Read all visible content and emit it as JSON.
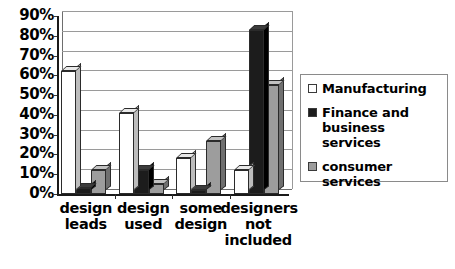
{
  "chart_data": {
    "type": "bar",
    "title": "",
    "xlabel": "",
    "ylabel": "",
    "ylim": [
      0,
      90
    ],
    "grid": true,
    "legend_position": "right",
    "categories": [
      "design leads",
      "design used",
      "some design",
      "designers not included"
    ],
    "category_lines": [
      [
        "design",
        "leads"
      ],
      [
        "design",
        "used"
      ],
      [
        "some",
        "design"
      ],
      [
        "designers",
        "not",
        "included"
      ]
    ],
    "ytick_labels": [
      "90%",
      "80%",
      "70%",
      "60%",
      "50%",
      "40%",
      "30%",
      "20%",
      "10%",
      "0%"
    ],
    "ytick_values": [
      90,
      80,
      70,
      60,
      50,
      40,
      30,
      20,
      10,
      0
    ],
    "series": [
      {
        "name": "Manufacturing",
        "color": "#ffffff",
        "values": [
          62,
          41,
          18,
          12
        ]
      },
      {
        "name": "Finance and business services",
        "color": "#1c1c1c",
        "values": [
          3,
          12,
          2,
          83
        ]
      },
      {
        "name": "consumer services",
        "color": "#9d9d9d",
        "values": [
          12,
          5,
          27,
          55
        ]
      }
    ]
  },
  "legend": {
    "items": [
      {
        "label": "Manufacturing",
        "swatch": "white-swatch"
      },
      {
        "label": "Finance and business services",
        "swatch": "black-swatch"
      },
      {
        "label": "consumer services",
        "swatch": "gray-swatch"
      }
    ]
  }
}
